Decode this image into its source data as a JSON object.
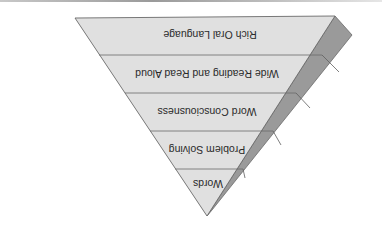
{
  "diagram": {
    "type": "inverted-pyramid",
    "orientation": "rotated-180",
    "colors": {
      "front_face": "#e0e0e0",
      "side_face": "#9a9a9a",
      "edge": "#6a6a6a",
      "text": "#2a2a2a"
    },
    "levels": [
      {
        "label": "Rich Oral Language"
      },
      {
        "label": "Wide Reading and Read Aloud"
      },
      {
        "label": "Word Consciousness"
      },
      {
        "label": "Problem Solving"
      },
      {
        "label": "Words"
      }
    ]
  }
}
